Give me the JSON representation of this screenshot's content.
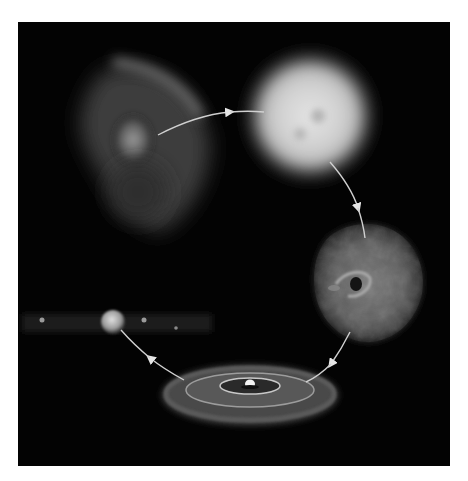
{
  "diagram": {
    "type": "cycle",
    "direction": "clockwise",
    "background_color": "#030303",
    "page_color": "#ffffff",
    "arrow_color": "#d8d8d8",
    "stages": [
      {
        "id": "nebula",
        "icon": "nebula-cloud-icon",
        "position": "top-left"
      },
      {
        "id": "bright-star",
        "icon": "glowing-star-icon",
        "position": "top-right"
      },
      {
        "id": "remnant-cloud",
        "icon": "turbulent-cloud-icon",
        "position": "right"
      },
      {
        "id": "protoplanetary-disk",
        "icon": "disk-icon",
        "position": "bottom"
      },
      {
        "id": "planetary-system",
        "icon": "planet-row-icon",
        "position": "left"
      }
    ],
    "arrows": [
      {
        "from": "nebula",
        "to": "bright-star"
      },
      {
        "from": "bright-star",
        "to": "remnant-cloud"
      },
      {
        "from": "remnant-cloud",
        "to": "protoplanetary-disk"
      },
      {
        "from": "protoplanetary-disk",
        "to": "planetary-system"
      }
    ]
  }
}
